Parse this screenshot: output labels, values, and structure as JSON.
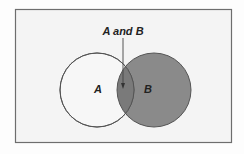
{
  "diagram": {
    "type": "venn",
    "labels": {
      "circle_a": "A",
      "circle_b": "B",
      "intersection_callout": "A and B"
    },
    "colors": {
      "background": "#fdfdfd",
      "frame_fill": "#f4f4f4",
      "frame_stroke": "#6e6e6e",
      "circle_a_fill": "#f7f7f7",
      "circle_b_fill": "#8a8a8a",
      "intersection_fill": "#7a7a7a",
      "stroke": "#555555"
    }
  }
}
